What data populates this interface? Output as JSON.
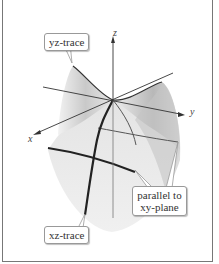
{
  "figure": {
    "axes": {
      "x": "x",
      "y": "y",
      "z": "z"
    },
    "callouts": {
      "yz_trace": "yz-trace",
      "xz_trace": "xz-trace",
      "parallel_line1": "parallel to",
      "parallel_line2": "xy-plane"
    }
  }
}
